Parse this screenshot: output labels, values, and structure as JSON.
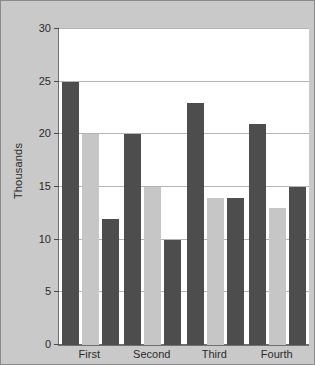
{
  "chart_data": {
    "type": "bar",
    "title": "",
    "xlabel": "",
    "ylabel": "Thousands",
    "categories": [
      "First",
      "Second",
      "Third",
      "Fourth"
    ],
    "series": [
      {
        "name": "Series 1",
        "color": "#4d4d4d",
        "values": [
          25,
          20,
          23,
          21
        ]
      },
      {
        "name": "Series 2",
        "color": "#c6c6c6",
        "values": [
          20,
          15,
          14,
          13
        ]
      },
      {
        "name": "Series 3",
        "color": "#4d4d4d",
        "values": [
          12,
          10,
          14,
          15
        ]
      }
    ],
    "ylim": [
      0,
      30
    ],
    "yticks": [
      0,
      5,
      10,
      15,
      20,
      25,
      30
    ],
    "ytick_labels": [
      "0",
      "5",
      "10",
      "15",
      "20",
      "25",
      "30"
    ],
    "grid": true,
    "legend": "none",
    "plot_background": "#ffffff",
    "frame_background": "#c9c9c9",
    "axis_color": "#6f6f6f",
    "gridline_color": "#b4b4b4"
  }
}
